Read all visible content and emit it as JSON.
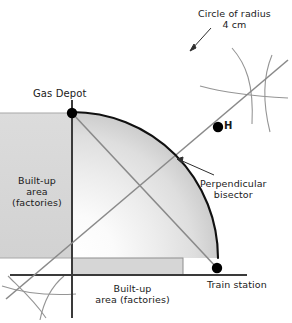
{
  "diagram": {
    "canvas": {
      "width": 292,
      "height": 323,
      "background": "#ffffff"
    },
    "labels": {
      "circle_radius_line1": "Circle of radius",
      "circle_radius_line2": "4 cm",
      "gas_depot": "Gas Depot",
      "point_h": "H",
      "perpendicular_line1": "Perpendicular",
      "perpendicular_line2": "bisector",
      "builtup_left_line1": "Built-up",
      "builtup_left_line2": "area",
      "builtup_left_line3": "(factories)",
      "builtup_bottom_line1": "Built-up",
      "builtup_bottom_line2": "area (factories)",
      "train_station": "Train station",
      "top_cut_text": "..."
    },
    "colors": {
      "axis": "#333333",
      "arc_circle": "#111111",
      "construction_line": "#8a8a8a",
      "construction_arc": "#8f8f8f",
      "point_fill": "#000000",
      "builtup_fill": "#d6d6d6",
      "builtup_stroke": "#9a9a9a",
      "quadrant_light": "#ffffff",
      "quadrant_dark": "#c9c9c9",
      "leader_line": "#333333",
      "text": "#1a1a1a"
    },
    "geometry": {
      "origin": {
        "x": 72,
        "y": 275
      },
      "gas_depot_point": {
        "x": 72,
        "y": 113
      },
      "train_station_point": {
        "x": 217,
        "y": 268
      },
      "point_h": {
        "x": 218,
        "y": 127
      },
      "circle_center": {
        "x": 72,
        "y": 258
      },
      "circle_radius_px": 146,
      "circle_radius_label_cm": 4,
      "arc_start_angle_deg": 0,
      "arc_end_angle_deg": 90,
      "builtup_left_rect": {
        "x": -10,
        "y": 113,
        "width": 82,
        "height": 145
      },
      "builtup_bottom_rect": {
        "x": 72,
        "y": 258,
        "width": 111,
        "height": 17
      },
      "x_axis": {
        "x1": 10,
        "y1": 275,
        "x2": 247,
        "y2": 275
      },
      "y_axis": {
        "x1": 72,
        "y1": 100,
        "x2": 72,
        "y2": 318
      },
      "perp_bisector_line": {
        "x1": 10,
        "y1": 296,
        "x2": 286,
        "y2": 62
      },
      "connector_line": {
        "x1": 72,
        "y1": 113,
        "x2": 217,
        "y2": 268
      },
      "arc_cross_right": {
        "x": 250,
        "y": 95
      },
      "arc_cross_bottomleft": {
        "x": 38,
        "y": 292
      },
      "leader_circle": {
        "x1": 209,
        "y1": 27,
        "x2": 190,
        "y2": 47
      },
      "leader_perp": {
        "x1": 212,
        "y1": 176,
        "x2": 179,
        "y2": 160
      }
    }
  }
}
